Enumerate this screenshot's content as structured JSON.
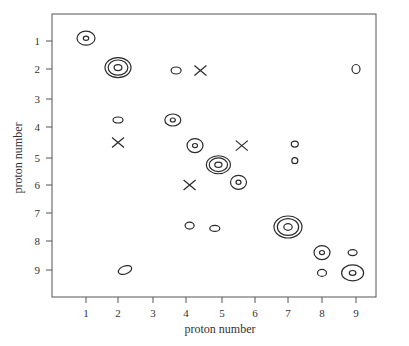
{
  "chart_data": {
    "type": "contour",
    "title": "",
    "xlabel": "proton number",
    "ylabel": "proton number",
    "x_ticks": [
      1,
      2,
      3,
      4,
      5,
      6,
      7,
      8,
      9
    ],
    "y_ticks": [
      1,
      2,
      3,
      4,
      5,
      6,
      7,
      8,
      9
    ],
    "xlim": [
      0,
      10
    ],
    "ylim": [
      10,
      0
    ],
    "y_inverted": true,
    "grid": false,
    "legend": null,
    "peaks": [
      {
        "x": 1.0,
        "y": 0.9,
        "rings": 2,
        "rx": 9,
        "ry": 7
      },
      {
        "x": 2.0,
        "y": 1.95,
        "rings": 3,
        "rx": 13,
        "ry": 10
      },
      {
        "x": 3.7,
        "y": 2.05,
        "rings": 1,
        "rx": 5,
        "ry": 3.5
      },
      {
        "x": 9.0,
        "y": 2.0,
        "rings": 1,
        "rx": 4,
        "ry": 4.5
      },
      {
        "x": 2.0,
        "y": 3.75,
        "rings": 1,
        "rx": 5,
        "ry": 3
      },
      {
        "x": 3.6,
        "y": 3.75,
        "rings": 2,
        "rx": 8,
        "ry": 6
      },
      {
        "x": 4.25,
        "y": 4.6,
        "rings": 2,
        "rx": 8,
        "ry": 7
      },
      {
        "x": 7.2,
        "y": 4.55,
        "rings": 1,
        "rx": 3.5,
        "ry": 3
      },
      {
        "x": 7.2,
        "y": 5.1,
        "rings": 1,
        "rx": 3,
        "ry": 3
      },
      {
        "x": 4.9,
        "y": 5.25,
        "rings": 3,
        "rx": 12,
        "ry": 9
      },
      {
        "x": 5.5,
        "y": 5.9,
        "rings": 2,
        "rx": 8,
        "ry": 7
      },
      {
        "x": 4.1,
        "y": 7.45,
        "rings": 1,
        "rx": 4.5,
        "ry": 3.5
      },
      {
        "x": 4.8,
        "y": 7.55,
        "rings": 1,
        "rx": 5,
        "ry": 3
      },
      {
        "x": 7.0,
        "y": 7.5,
        "rings": 3,
        "rx": 14,
        "ry": 11
      },
      {
        "x": 8.0,
        "y": 8.4,
        "rings": 2,
        "rx": 8,
        "ry": 7
      },
      {
        "x": 8.9,
        "y": 8.4,
        "rings": 1,
        "rx": 4.5,
        "ry": 3
      },
      {
        "x": 8.0,
        "y": 9.1,
        "rings": 1,
        "rx": 4.5,
        "ry": 3.5
      },
      {
        "x": 8.9,
        "y": 9.1,
        "rings": 2,
        "rx": 11,
        "ry": 8
      },
      {
        "x": 2.2,
        "y": 9.0,
        "rings": 1,
        "rx": 7,
        "ry": 4,
        "rotate": -20
      }
    ],
    "crosses": [
      {
        "x": 4.4,
        "y": 2.05
      },
      {
        "x": 2.0,
        "y": 4.5
      },
      {
        "x": 5.6,
        "y": 4.6
      },
      {
        "x": 4.1,
        "y": 6.0
      }
    ]
  },
  "colors": {
    "line": "#2a2a2a",
    "axis": "#555555",
    "background": "#ffffff"
  }
}
